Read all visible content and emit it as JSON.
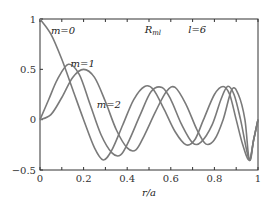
{
  "chart_data": {
    "type": "line",
    "title": "",
    "xlabel": "r/a",
    "ylabel": "",
    "xlim": [
      0,
      1
    ],
    "ylim": [
      -0.5,
      1
    ],
    "grid": false,
    "x_ticks": [
      "0",
      "0.2",
      "0.4",
      "0.6",
      "0.8",
      "1"
    ],
    "y_ticks": [
      "-0.5",
      "0",
      "0.5",
      "1"
    ],
    "annotations": [
      {
        "text": "R_ml",
        "x": 0.48,
        "y": 0.86
      },
      {
        "text": "l=6",
        "x": 0.68,
        "y": 0.86
      },
      {
        "text": "m=0",
        "x": 0.05,
        "y": 0.85
      },
      {
        "text": "m=1",
        "x": 0.14,
        "y": 0.52
      },
      {
        "text": "m=2",
        "x": 0.26,
        "y": 0.12
      }
    ],
    "series": [
      {
        "name": "m=0",
        "x": [
          0,
          0.05,
          0.1,
          0.15,
          0.2,
          0.25,
          0.29,
          0.33,
          0.38,
          0.43,
          0.48,
          0.52,
          0.57,
          0.62,
          0.67,
          0.71,
          0.75,
          0.8,
          0.84,
          0.87,
          0.9,
          0.93,
          0.96,
          0.98,
          1.0
        ],
        "y": [
          1.0,
          0.85,
          0.6,
          0.3,
          0.0,
          -0.28,
          -0.4,
          -0.3,
          -0.05,
          0.2,
          0.33,
          0.3,
          0.1,
          -0.12,
          -0.25,
          -0.2,
          0.0,
          0.25,
          0.33,
          0.25,
          0.0,
          -0.25,
          -0.4,
          -0.2,
          0.0
        ]
      },
      {
        "name": "m=1",
        "x": [
          0,
          0.04,
          0.08,
          0.13,
          0.18,
          0.23,
          0.28,
          0.33,
          0.37,
          0.41,
          0.46,
          0.51,
          0.56,
          0.6,
          0.65,
          0.7,
          0.74,
          0.79,
          0.83,
          0.86,
          0.89,
          0.92,
          0.96,
          0.98,
          1.0
        ],
        "y": [
          0.0,
          0.2,
          0.4,
          0.55,
          0.45,
          0.15,
          -0.15,
          -0.33,
          -0.35,
          -0.2,
          0.05,
          0.28,
          0.32,
          0.2,
          -0.05,
          -0.23,
          -0.22,
          -0.05,
          0.2,
          0.33,
          0.25,
          0.0,
          -0.4,
          -0.2,
          0.0
        ]
      },
      {
        "name": "m=2",
        "x": [
          0,
          0.05,
          0.1,
          0.15,
          0.2,
          0.25,
          0.3,
          0.35,
          0.4,
          0.44,
          0.48,
          0.53,
          0.58,
          0.62,
          0.67,
          0.72,
          0.76,
          0.8,
          0.84,
          0.88,
          0.91,
          0.94,
          0.96,
          0.98,
          1.0
        ],
        "y": [
          0.0,
          0.05,
          0.22,
          0.42,
          0.5,
          0.42,
          0.18,
          -0.1,
          -0.28,
          -0.3,
          -0.15,
          0.08,
          0.28,
          0.32,
          0.15,
          -0.1,
          -0.24,
          -0.2,
          0.0,
          0.3,
          0.25,
          0.0,
          -0.4,
          -0.2,
          0.0
        ]
      }
    ]
  }
}
